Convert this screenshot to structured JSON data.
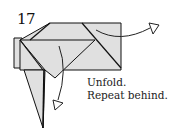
{
  "diagram": {
    "step_number": "17",
    "instructions": [
      "Unfold.",
      "Repeat behind."
    ],
    "colors": {
      "paper_fill": "#e0e0e0",
      "line": "#111111",
      "background": "#ffffff"
    },
    "arrows": [
      {
        "name": "unfold-arrow-right",
        "direction": "right"
      },
      {
        "name": "unfold-arrow-down",
        "direction": "down"
      }
    ]
  }
}
